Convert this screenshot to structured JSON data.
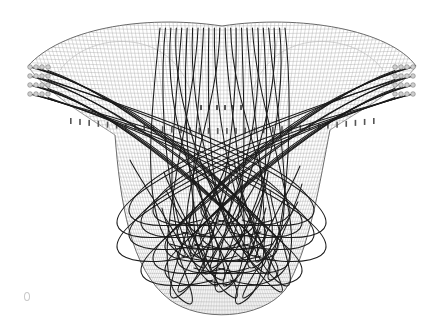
{
  "image": {
    "subject": "3D wireframe string-art sculpture",
    "background_color": "#ffffff",
    "mesh_color": "#9a9a9a",
    "string_color": "#1a1a1a",
    "peg_color": "#cfcfcf",
    "style": "monochrome line rendering"
  },
  "elements": {
    "left_peg_rows": 4,
    "right_peg_rows": 4,
    "pegs_per_row": 4,
    "top_anchor_strings": 24,
    "corner_mark": "small circular mark bottom-left"
  }
}
